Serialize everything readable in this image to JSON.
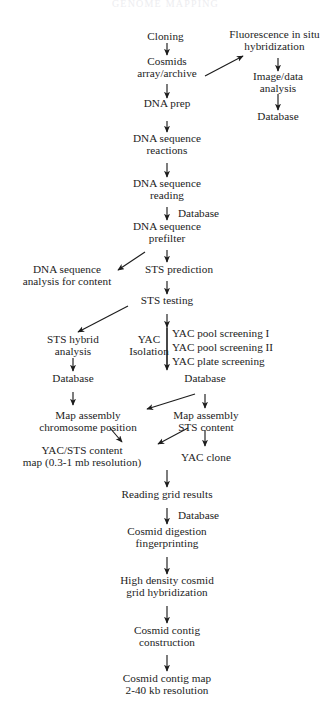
{
  "figure": {
    "cropped_header": "GENOME MAPPING",
    "background_color": "#ffffff",
    "ink_color": "#1c1c1c",
    "width": 331,
    "height": 722
  },
  "nodes": {
    "cloning": "Cloning",
    "cosmids_l1": "Cosmids",
    "cosmids_l2": "array/archive",
    "fish_l1": "Fluorescence in situ",
    "fish_l2": "hybridization",
    "image_data_l1": "Image/data",
    "image_data_l2": "analysis",
    "database_fish": "Database",
    "dna_prep": "DNA prep",
    "dna_seq_reactions_l1": "DNA sequence",
    "dna_seq_reactions_l2": "reactions",
    "dna_seq_reading_l1": "DNA sequence",
    "dna_seq_reading_l2": "reading",
    "database_prefilter": "Database",
    "dna_seq_prefilter_l1": "DNA sequence",
    "dna_seq_prefilter_l2": "prefilter",
    "dna_seq_analysis_l1": "DNA sequence",
    "dna_seq_analysis_l2": "analysis for content",
    "sts_prediction": "STS prediction",
    "sts_testing": "STS testing",
    "sts_hybrid_l1": "STS hybrid",
    "sts_hybrid_l2": "analysis",
    "yac_isolation_l1": "YAC",
    "yac_isolation_l2": "Isolation",
    "yac_pool_screening_1": "YAC pool screening I",
    "yac_pool_screening_2": "YAC pool screening II",
    "yac_plate_screening": "YAC plate screening",
    "database_sts_hybrid": "Database",
    "database_yac": "Database",
    "map_assembly_chrom_l1": "Map assembly",
    "map_assembly_chrom_l2": "chromosome position",
    "map_assembly_sts_l1": "Map assembly",
    "map_assembly_sts_l2": "STS content",
    "yac_sts_map_l1": "YAC/STS content",
    "yac_sts_map_l2": "map (0.3-1 mb resolution)",
    "yac_clone": "YAC clone",
    "reading_grid_results": "Reading grid results",
    "database_grid": "Database",
    "cosmid_digestion_l1": "Cosmid digestion",
    "cosmid_digestion_l2": "fingerprinting",
    "high_density_l1": "High density cosmid",
    "high_density_l2": "grid hybridization",
    "cosmid_contig_l1": "Cosmid contig",
    "cosmid_contig_l2": "construction",
    "cosmid_contig_map_l1": "Cosmid contig map",
    "cosmid_contig_map_l2": "2-40 kb resolution"
  },
  "flow_steps": [
    "Cloning",
    "Cosmids array/archive",
    "Fluorescence in situ hybridization",
    "Image/data analysis",
    "Database",
    "DNA prep",
    "DNA sequence reactions",
    "DNA sequence reading",
    "DNA sequence prefilter",
    "DNA sequence analysis for content",
    "STS prediction",
    "STS testing",
    "STS hybrid analysis",
    "YAC Isolation",
    "YAC pool screening I",
    "YAC pool screening II",
    "YAC plate screening",
    "Database",
    "Map assembly chromosome position",
    "Map assembly STS content",
    "YAC/STS content map (0.3-1 mb resolution)",
    "YAC clone",
    "Reading grid results",
    "Cosmid digestion fingerprinting",
    "High density cosmid grid hybridization",
    "Cosmid contig construction",
    "Cosmid contig map 2-40 kb resolution"
  ]
}
